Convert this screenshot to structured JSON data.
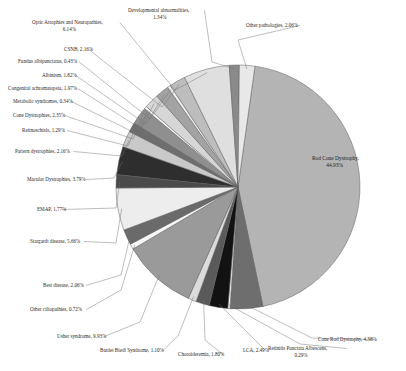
{
  "chart_data": {
    "type": "pie",
    "title": "",
    "subtitle": "",
    "xlabel": "",
    "ylabel": "",
    "legend_position": "none",
    "grid": false,
    "value_unit": "%",
    "categories": [
      "Rod Cone Dystrophy",
      "Cone Rod Dystrophy",
      "Retinitis Punctata Albescens",
      "LCA",
      "Choroideremia",
      "Bardet Biedl Syndrome",
      "Usher syndrome",
      "Other ciliopathies",
      "Best disease",
      "Stargardt disease",
      "EMAP",
      "Macular Dystrophies",
      "Pattern dystrophies",
      "Retinoschisis",
      "Cone Dystrophies",
      "Metabolic syndromes",
      "Congenital achromatopsia",
      "Albinism",
      "Fundus albipunctatus",
      "CSNB",
      "Optic Atrophies and Neuropathies",
      "Developmental abnormalities",
      "Other pathologies"
    ],
    "values": [
      44.93,
      4.38,
      0.29,
      2.49,
      1.8,
      1.1,
      9.93,
      0.72,
      2.06,
      5.66,
      1.77,
      3.79,
      2.16,
      1.29,
      2.35,
      0.34,
      1.97,
      1.82,
      0.43,
      2.16,
      6.14,
      1.34,
      2.06
    ],
    "slice_colors": [
      "#b4b4b4",
      "#6e6e6e",
      "#f2f2f2",
      "#121212",
      "#5a5a5a",
      "#dcdcdc",
      "#9a9a9a",
      "#f7f7f7",
      "#6a6a6a",
      "#ededed",
      "#4a4a4a",
      "#2e2e2e",
      "#c9c9c9",
      "#6e6e6e",
      "#8f8f8f",
      "#ffffff",
      "#d6d6d6",
      "#a3a3a3",
      "#eeeeee",
      "#bdbdbd",
      "#dfdfdf",
      "#8a8a8a",
      "#e8e8e8"
    ],
    "labels": [
      {
        "key": "rod-cone-dystrophy",
        "name": "Rod Cone Dystrophy",
        "value": 44.93,
        "text_line1": "Rod Cone Dystrophy,",
        "text_line2": "44.93%",
        "text": "Rod Cone Dystrophy, 44.93%"
      },
      {
        "key": "cone-rod-dystrophy",
        "name": "Cone Rod Dystrophy",
        "value": 4.38,
        "text": "Cone Rod Dystrophy, 4.38%"
      },
      {
        "key": "retinitis-punctata-albescens",
        "name": "Retinitis Punctata Albescens",
        "value": 0.29,
        "text_line1": "Retinitis Punctata Albescens,",
        "text_line2": "0.29%",
        "text": "Retinitis Punctata Albescens, 0.29%"
      },
      {
        "key": "lca",
        "name": "LCA",
        "value": 2.49,
        "text": "LCA, 2.49%"
      },
      {
        "key": "choroideremia",
        "name": "Choroideremia",
        "value": 1.8,
        "text": "Choroideremia, 1.80%"
      },
      {
        "key": "bardet-biedl-syndrome",
        "name": "Bardet Biedl Syndrome",
        "value": 1.1,
        "text": "Bardet Biedl Syndrome, 1.10%"
      },
      {
        "key": "usher-syndrome",
        "name": "Usher syndrome",
        "value": 9.93,
        "text": "Usher syndrome, 9.93%"
      },
      {
        "key": "other-ciliopathies",
        "name": "Other ciliopathies",
        "value": 0.72,
        "text": "Other ciliopathies, 0.72%"
      },
      {
        "key": "best-disease",
        "name": "Best disease",
        "value": 2.06,
        "text": "Best disease, 2.06%"
      },
      {
        "key": "stargardt-disease",
        "name": "Stargardt disease",
        "value": 5.66,
        "text": "Stargardt disease, 5.66%"
      },
      {
        "key": "emap",
        "name": "EMAP",
        "value": 1.77,
        "text": "EMAP, 1.77%"
      },
      {
        "key": "macular-dystrophies",
        "name": "Macular Dystrophies",
        "value": 3.79,
        "text": "Macular Dystrophies, 3.79%"
      },
      {
        "key": "pattern-dystrophies",
        "name": "Pattern dystrophies",
        "value": 2.16,
        "text": "Pattern dystrophies, 2.16%"
      },
      {
        "key": "retinoschisis",
        "name": "Retinoschisis",
        "value": 1.29,
        "text": "Retinoschisis, 1.29%"
      },
      {
        "key": "cone-dystrophies",
        "name": "Cone Dystrophies",
        "value": 2.35,
        "text": "Cone Dystrophies, 2.35%"
      },
      {
        "key": "metabolic-syndromes",
        "name": "Metabolic syndromes",
        "value": 0.34,
        "text": "Metabolic syndromes, 0.34%"
      },
      {
        "key": "congenital-achromatopsia",
        "name": "Congenital achromatopsia",
        "value": 1.97,
        "text": "Congenital achromatopsia, 1.97%"
      },
      {
        "key": "albinism",
        "name": "Albinism",
        "value": 1.82,
        "text": "Albinism, 1.82%"
      },
      {
        "key": "fundus-albipunctatus",
        "name": "Fundus albipunctatus",
        "value": 0.43,
        "text": "Fundus albipunctatus, 0.43%"
      },
      {
        "key": "csnb",
        "name": "CSNB",
        "value": 2.16,
        "text": "CSNB, 2.16%"
      },
      {
        "key": "optic-atrophies-and-neuropathies",
        "name": "Optic Atrophies and Neuropathies",
        "value": 6.14,
        "text_line1": "Optic Atrophies and Neuropathies,",
        "text_line2": "6.14%",
        "text": "Optic Atrophies and Neuropathies, 6.14%"
      },
      {
        "key": "developmental-abnormalities",
        "name": "Developmental abnormalities",
        "value": 1.34,
        "text_line1": "Developmental abnormalities,",
        "text_line2": "1.34%",
        "text": "Developmental abnormalities, 1.34%"
      },
      {
        "key": "other-pathologies",
        "name": "Other pathologies",
        "value": 2.06,
        "text": "Other pathologies, 2.06%"
      }
    ]
  }
}
